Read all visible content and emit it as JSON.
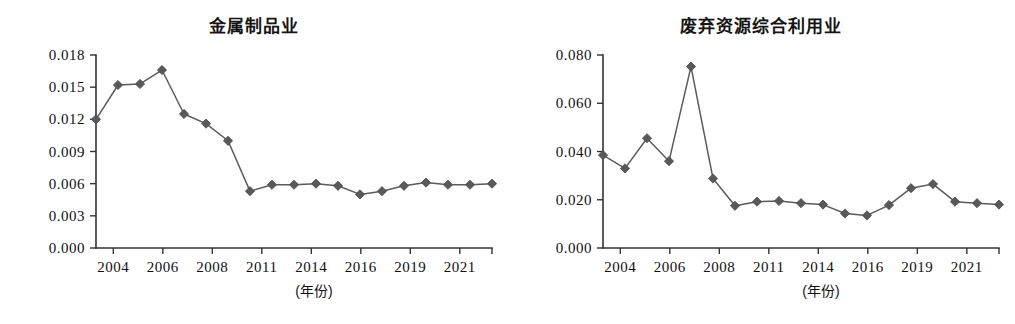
{
  "figure": {
    "width": 1015,
    "height": 324,
    "background": "#ffffff",
    "marker_color": "#595959",
    "line_color": "#5b5b5b",
    "axis_color": "#333333"
  },
  "chart_data": [
    {
      "type": "line",
      "title": "金属制品业",
      "xlabel": "(年份)",
      "ylabel": "",
      "x": [
        2004,
        2005,
        2006,
        2007,
        2008,
        2009,
        2010,
        2011,
        2012,
        2013,
        2014,
        2015,
        2016,
        2017,
        2018,
        2019,
        2020,
        2021,
        2022
      ],
      "values": [
        0.012,
        0.0152,
        0.0153,
        0.0166,
        0.0125,
        0.0116,
        0.01,
        0.0053,
        0.0059,
        0.0059,
        0.006,
        0.0058,
        0.005,
        0.0053,
        0.0058,
        0.0061,
        0.0059,
        0.0059,
        0.006
      ],
      "series": [
        {
          "name": "金属制品业",
          "values": [
            0.012,
            0.0152,
            0.0153,
            0.0166,
            0.0125,
            0.0116,
            0.01,
            0.0053,
            0.0059,
            0.0059,
            0.006,
            0.0058,
            0.005,
            0.0053,
            0.0058,
            0.0061,
            0.0059,
            0.0059,
            0.006
          ]
        }
      ],
      "ylim": [
        0.0,
        0.018
      ],
      "yticks": [
        0.0,
        0.003,
        0.006,
        0.009,
        0.012,
        0.015,
        0.018
      ],
      "ytick_labels": [
        "0.000",
        "0.003",
        "0.006",
        "0.009",
        "0.012",
        "0.015",
        "0.018"
      ],
      "xticks": [
        2004,
        2006,
        2008,
        2011,
        2014,
        2016,
        2019,
        2021
      ],
      "xtick_labels": [
        "2004",
        "2006",
        "2008",
        "2011",
        "2014",
        "2016",
        "2019",
        "2021"
      ],
      "grid": false,
      "legend": "none"
    },
    {
      "type": "line",
      "title": "废弃资源综合利用业",
      "xlabel": "(年份)",
      "ylabel": "",
      "x": [
        2004,
        2005,
        2006,
        2007,
        2008,
        2009,
        2010,
        2011,
        2012,
        2013,
        2014,
        2015,
        2016,
        2017,
        2018,
        2019,
        2020,
        2021,
        2022
      ],
      "values": [
        0.0385,
        0.033,
        0.0455,
        0.036,
        0.0752,
        0.0288,
        0.0175,
        0.0192,
        0.0195,
        0.0186,
        0.018,
        0.0143,
        0.0135,
        0.0178,
        0.0248,
        0.0265,
        0.0192,
        0.0186,
        0.018
      ],
      "series": [
        {
          "name": "废弃资源综合利用业",
          "values": [
            0.0385,
            0.033,
            0.0455,
            0.036,
            0.0752,
            0.0288,
            0.0175,
            0.0192,
            0.0195,
            0.0186,
            0.018,
            0.0143,
            0.0135,
            0.0178,
            0.0248,
            0.0265,
            0.0192,
            0.0186,
            0.018
          ]
        }
      ],
      "ylim": [
        0.0,
        0.08
      ],
      "yticks": [
        0.0,
        0.02,
        0.04,
        0.06,
        0.08
      ],
      "ytick_labels": [
        "0.000",
        "0.020",
        "0.040",
        "0.060",
        "0.080"
      ],
      "xticks": [
        2004,
        2006,
        2008,
        2011,
        2014,
        2016,
        2019,
        2021
      ],
      "xtick_labels": [
        "2004",
        "2006",
        "2008",
        "2011",
        "2014",
        "2016",
        "2019",
        "2021"
      ],
      "grid": false,
      "legend": "none"
    }
  ]
}
